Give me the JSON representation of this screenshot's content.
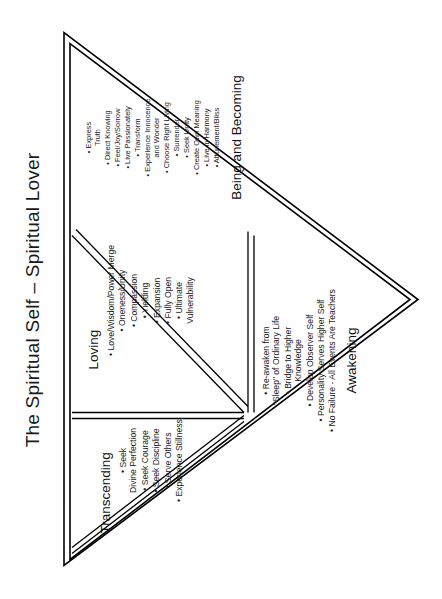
{
  "page": {
    "title": "The Spiritual Self – Spiritual Lover",
    "orientation": "rotated-90-ccw",
    "background_color": "#ffffff",
    "ink_color": "#000000"
  },
  "diagram": {
    "type": "nested-triangle",
    "outer_shape": "large inverted triangle subdivided into four triangles",
    "zones": [
      {
        "id": "transcending",
        "label": "Transcending",
        "position": "upper-left triangle",
        "items": [
          "Seek\nDivine Perfection",
          "Seek Courage",
          "Seek Discipline",
          "Serve Others",
          "Experience Stillness"
        ]
      },
      {
        "id": "loving",
        "label": "Loving",
        "position": "center inverted triangle",
        "items": [
          "Love/Wisdom/Power Merge",
          "Oneness/Unity",
          "Compassion",
          "Yielding",
          "Expansion",
          "Fully Open",
          "Ultimate\nVulnerability"
        ]
      },
      {
        "id": "awakening",
        "label": "Awakening",
        "position": "lower-left triangle",
        "items": [
          "Re-awaken from\n\"Sleep\" of Ordinary Life",
          "Bridge to Higher\nKnowledge",
          "Develop Observer Self",
          "Personality Serves Higher Self",
          "No Failure - All Events Are Teachers"
        ]
      },
      {
        "id": "being-and-becoming",
        "label": "Being and Becoming",
        "position": "right-hand triangle",
        "items": [
          "Express\nTruth",
          "Direct Knowing",
          "Feel/Joy/Sorrow",
          "Live Passionately",
          "Transform",
          "Experience Innocence\nand Wonder",
          "Choose Right Living",
          "Surrender",
          "Seek Unity",
          "Create Own Meaning",
          "Live in Harmony",
          "Attunement/Bliss"
        ]
      }
    ]
  }
}
